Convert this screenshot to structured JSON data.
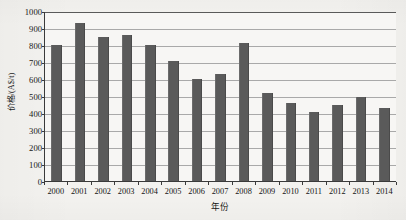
{
  "chart_data": {
    "type": "bar",
    "title": "",
    "xlabel": "年份",
    "ylabel": "价格/(A$/t)",
    "categories": [
      "2000",
      "2001",
      "2002",
      "2003",
      "2004",
      "2005",
      "2006",
      "2007",
      "2008",
      "2009",
      "2010",
      "2011",
      "2012",
      "2013",
      "2014"
    ],
    "values": [
      800,
      930,
      845,
      860,
      800,
      708,
      602,
      628,
      812,
      520,
      457,
      405,
      448,
      492,
      430
    ],
    "ylim": [
      0,
      1000
    ],
    "y_ticks": [
      0,
      100,
      200,
      300,
      400,
      500,
      600,
      700,
      800,
      900,
      1000
    ],
    "y_tick_labels": [
      "0",
      "100",
      "200",
      "300",
      "400",
      "500",
      "600",
      "700",
      "800",
      "900",
      "1000"
    ],
    "grid": true,
    "legend": false,
    "series": [
      {
        "name": "价格",
        "values": [
          800,
          930,
          845,
          860,
          800,
          708,
          602,
          628,
          812,
          520,
          457,
          405,
          448,
          492,
          430
        ]
      }
    ],
    "colors": {
      "bar": "#5a5a5a",
      "gridline": "#a9a9a9",
      "axis": "#3a3a3a",
      "plot_background": "#f7f6f4",
      "page_background": "#f3f2ef",
      "text": "#141414"
    }
  }
}
